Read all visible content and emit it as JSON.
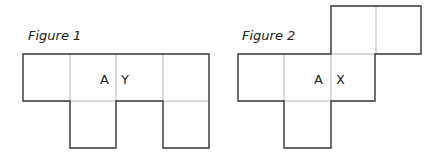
{
  "figures": [
    {
      "title": "Figure 1",
      "labels": [
        "A",
        "Y"
      ],
      "description": "cube net: row of 4 squares with squares hanging below 2nd and 4th"
    },
    {
      "title": "Figure 2",
      "labels": [
        "A",
        "X"
      ],
      "description": "cube net: 2 squares top-right, 3 squares middle, 1 square below 2nd"
    }
  ],
  "colors": {
    "outline": "#333333",
    "inner_line": "#b5b5b5"
  }
}
